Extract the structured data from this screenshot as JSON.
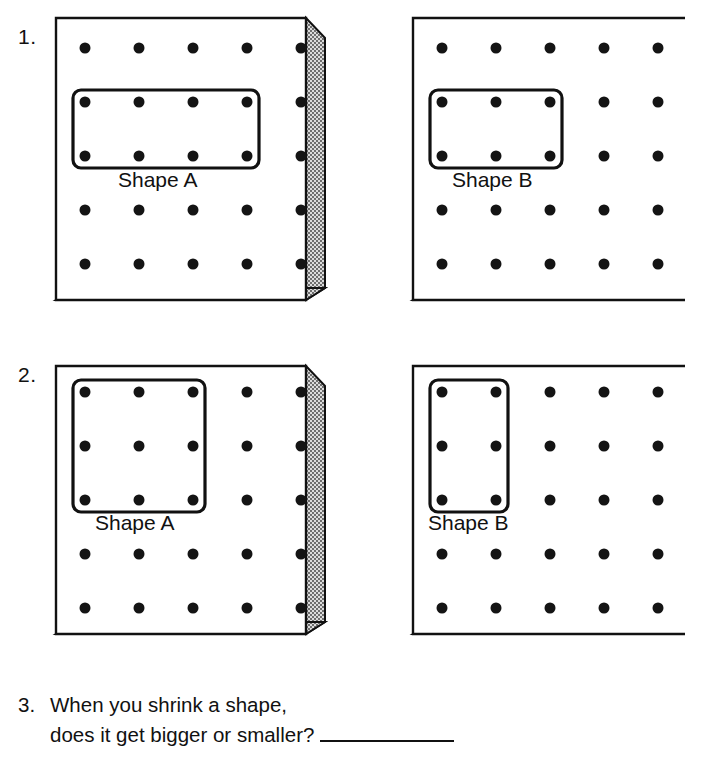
{
  "worksheet": {
    "title": "Shrinking Shapes Geoboard Worksheet",
    "background_color": "#ffffff",
    "ink_color": "#111111"
  },
  "board_style": {
    "face_fill": "#ffffff",
    "edge_fill": "#d9d9d9",
    "stipple_color": "#3a3a3a",
    "outline_color": "#111111",
    "peg_color": "#141414",
    "grid_rows": 5,
    "grid_cols": 5,
    "peg_radius_px": 5.5,
    "shape_stroke_width_px": 3.2,
    "shape_corner_radius_px": 7
  },
  "problems": [
    {
      "number": "1.",
      "boards": [
        {
          "id": "p1-board-a",
          "label": "Shape A",
          "shape": {
            "col_start": 0,
            "col_end": 3,
            "row_start": 1,
            "row_end": 2,
            "description": "rectangle 4 pegs wide by 2 pegs tall"
          }
        },
        {
          "id": "p1-board-b",
          "label": "Shape B",
          "shape": {
            "col_start": 0,
            "col_end": 2,
            "row_start": 1,
            "row_end": 2,
            "description": "rectangle 3 pegs wide by 2 pegs tall"
          }
        }
      ]
    },
    {
      "number": "2.",
      "boards": [
        {
          "id": "p2-board-a",
          "label": "Shape A",
          "shape": {
            "col_start": 0,
            "col_end": 2,
            "row_start": 0,
            "row_end": 2,
            "description": "square 3 pegs wide by 3 pegs tall"
          }
        },
        {
          "id": "p2-board-b",
          "label": "Shape B",
          "shape": {
            "col_start": 0,
            "col_end": 1,
            "row_start": 0,
            "row_end": 2,
            "description": "rectangle 2 pegs wide by 3 pegs tall"
          }
        }
      ]
    }
  ],
  "question": {
    "number": "3.",
    "line1": "When you shrink a shape,",
    "line2": "does it get bigger or smaller?",
    "answer_value": ""
  }
}
